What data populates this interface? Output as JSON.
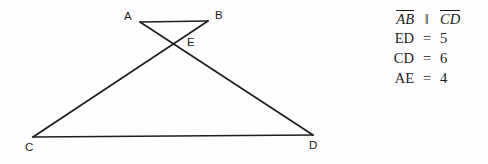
{
  "figure": {
    "name": "bowtie-triangles-diagram",
    "stroke_color": "#1e1e1e",
    "background": "#fefefe",
    "vertices": [
      {
        "id": "A",
        "label": "A",
        "x": 140,
        "y": 22,
        "label_x": 124,
        "label_y": 11
      },
      {
        "id": "B",
        "label": "B",
        "x": 208,
        "y": 21,
        "label_x": 215,
        "label_y": 10
      },
      {
        "id": "E",
        "label": "E",
        "x": 174,
        "y": 43,
        "label_x": 187,
        "label_y": 37
      },
      {
        "id": "C",
        "label": "C",
        "x": 33,
        "y": 137,
        "label_x": 25,
        "label_y": 142
      },
      {
        "id": "D",
        "label": "D",
        "x": 313,
        "y": 135,
        "label_x": 309,
        "label_y": 140
      }
    ],
    "segments": [
      {
        "id": "AB",
        "from": "A",
        "to": "B"
      },
      {
        "id": "CD",
        "from": "C",
        "to": "D"
      },
      {
        "id": "AD",
        "from": "A",
        "to": "D"
      },
      {
        "id": "BC",
        "from": "B",
        "to": "C"
      }
    ]
  },
  "facts": {
    "parallel": {
      "left": "AB",
      "symbol": "‖",
      "right": "CD"
    },
    "rows": [
      {
        "lhs": "ED",
        "rel": "=",
        "rhs": "5"
      },
      {
        "lhs": "CD",
        "rel": "=",
        "rhs": "6"
      },
      {
        "lhs": "AE",
        "rel": "=",
        "rhs": "4"
      }
    ]
  }
}
